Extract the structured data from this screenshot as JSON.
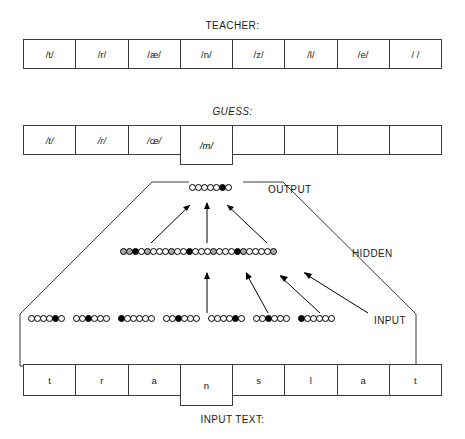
{
  "diagram": {
    "title_teacher": "TEACHER:",
    "title_guess": "GUESS:",
    "title_input_text": "INPUT TEXT:",
    "label_output": "OUTPUT",
    "label_hidden": "HIDDEN",
    "label_input": "INPUT"
  },
  "teacher_row": {
    "cells": [
      "/t/",
      "/r/",
      "/æ/",
      "/n/",
      "/z/",
      "/l/",
      "/e/",
      "/ /"
    ],
    "focus_index": null
  },
  "guess_row": {
    "cells": [
      "/t/",
      "/r/",
      "/œ/",
      "/m/",
      "",
      "",
      "",
      ""
    ],
    "focus_index": 3,
    "focus_value": "/m/"
  },
  "input_text_row": {
    "cells": [
      "t",
      "r",
      "a",
      "n",
      "s",
      "l",
      "a",
      "t"
    ],
    "focus_index": 3,
    "focus_value": "n"
  },
  "network": {
    "output_layer": {
      "count": 7,
      "states": [
        "off",
        "off",
        "off",
        "off",
        "off",
        "on",
        "off"
      ]
    },
    "hidden_layer": {
      "count": 26,
      "states": [
        "mid",
        "mid",
        "on",
        "off",
        "mid",
        "off",
        "off",
        "off",
        "mid",
        "off",
        "off",
        "on",
        "off",
        "off",
        "off",
        "mid",
        "off",
        "off",
        "off",
        "on",
        "mid",
        "off",
        "off",
        "off",
        "off",
        "mid"
      ]
    },
    "input_layer": {
      "group_count": 7,
      "units_per_group": 6,
      "active_unit_per_group": [
        5,
        3,
        1,
        3,
        5,
        3,
        1
      ]
    },
    "arrows": {
      "hidden_to_output": 3,
      "input_to_hidden": 5
    }
  },
  "colors": {
    "stroke": "#3a3a3a",
    "unit_on": "#000000",
    "unit_mid": "#a8a8a8",
    "unit_off": "#ffffff",
    "text": "#1a1a1a",
    "background": "#ffffff"
  }
}
